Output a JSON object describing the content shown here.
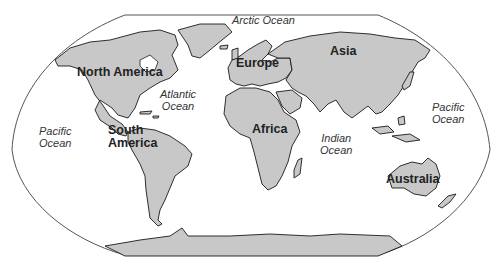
{
  "map": {
    "projection": "Robinson-style world map",
    "land_color": "#c8c8c8",
    "outline_color": "#1a1a1a",
    "continents": [
      {
        "id": "north-america",
        "label": "North America"
      },
      {
        "id": "south-america",
        "label": "South America",
        "lines": [
          "South",
          "America"
        ]
      },
      {
        "id": "europe",
        "label": "Europe"
      },
      {
        "id": "asia",
        "label": "Asia"
      },
      {
        "id": "africa",
        "label": "Africa"
      },
      {
        "id": "australia",
        "label": "Australia"
      }
    ],
    "oceans": [
      {
        "id": "arctic",
        "lines": [
          "Arctic Ocean"
        ]
      },
      {
        "id": "atlantic",
        "lines": [
          "Atlantic",
          "Ocean"
        ]
      },
      {
        "id": "pacific-west",
        "lines": [
          "Pacific",
          "Ocean"
        ]
      },
      {
        "id": "pacific-east",
        "lines": [
          "Pacific",
          "Ocean"
        ]
      },
      {
        "id": "indian",
        "lines": [
          "Indian",
          "Ocean"
        ]
      }
    ]
  }
}
